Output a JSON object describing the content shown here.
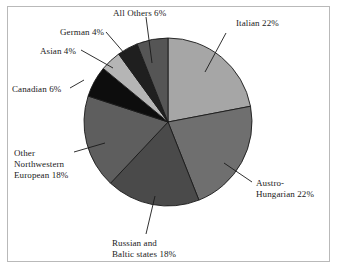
{
  "chart_data": {
    "type": "pie",
    "title": "",
    "subtitle": "",
    "xlabel": "",
    "ylabel": "",
    "legend_position": "none",
    "grid": false,
    "labels_outside": true,
    "start_angle_deg": 0,
    "direction": "clockwise",
    "total_percent": 100,
    "categories": [
      "Italian",
      "Austro-Hungarian",
      "Russian and Baltic states",
      "Other Northwestern European",
      "Canadian",
      "Asian",
      "German",
      "All Others"
    ],
    "values": [
      22,
      22,
      18,
      18,
      6,
      4,
      4,
      6
    ],
    "unit": "%",
    "colors": [
      "#a6a6a6",
      "#6f6f6f",
      "#4a4a4a",
      "#5e5e5e",
      "#0d0d0d",
      "#b5b5b5",
      "#1f1f1f",
      "#555555"
    ],
    "slice_border_color": "#1a1a1a"
  },
  "slices": [
    {
      "name": "italian",
      "label_lines": [
        "Italian 22%"
      ],
      "percent": 22,
      "color": "#a6a6a6"
    },
    {
      "name": "austro-hungarian",
      "label_lines": [
        "Austro-",
        "Hungarian 22%"
      ],
      "percent": 22,
      "color": "#6f6f6f"
    },
    {
      "name": "russian-baltic",
      "label_lines": [
        "Russian and",
        "Baltic states 18%"
      ],
      "percent": 18,
      "color": "#4a4a4a"
    },
    {
      "name": "other-northwestern-european",
      "label_lines": [
        "Other",
        "Northwestern",
        "European 18%"
      ],
      "percent": 18,
      "color": "#5e5e5e"
    },
    {
      "name": "canadian",
      "label_lines": [
        "Canadian 6%"
      ],
      "percent": 6,
      "color": "#0d0d0d"
    },
    {
      "name": "asian",
      "label_lines": [
        "Asian 4%"
      ],
      "percent": 4,
      "color": "#b5b5b5"
    },
    {
      "name": "german",
      "label_lines": [
        "German 4%"
      ],
      "percent": 4,
      "color": "#1f1f1f"
    },
    {
      "name": "all-others",
      "label_lines": [
        "All Others 6%"
      ],
      "percent": 6,
      "color": "#555555"
    }
  ],
  "labels": {
    "italian": "Italian 22%",
    "austro_line1": "Austro-",
    "austro_line2": "Hungarian 22%",
    "russian_line1": "Russian and",
    "russian_line2": "Baltic states 18%",
    "othernw_line1": "Other",
    "othernw_line2": "Northwestern",
    "othernw_line3": "European 18%",
    "canadian": "Canadian 6%",
    "asian": "Asian 4%",
    "german": "German 4%",
    "all_others": "All Others 6%"
  },
  "geometry": {
    "center_x": 168,
    "center_y": 122,
    "radius": 84
  }
}
